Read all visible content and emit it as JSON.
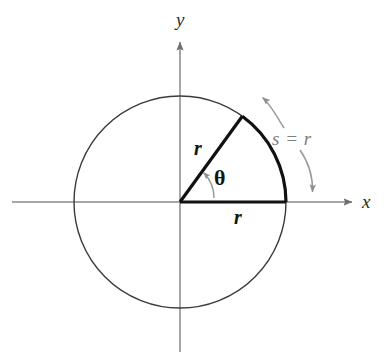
{
  "figure": {
    "background_color": "#ffffff"
  },
  "axes": {
    "x_label": "x",
    "y_label": "y",
    "axis_color": "#8a8a8a",
    "origin": {
      "x": 180,
      "y": 202
    }
  },
  "circle": {
    "center_x": 180,
    "center_y": 202,
    "radius": 106,
    "stroke_color": "#3a3a3a",
    "stroke_width": 1.4
  },
  "sector": {
    "radius_horizontal_label": "r",
    "radius_slanted_label": "r",
    "angle_label": "θ",
    "arc_label": "s = r",
    "angle_degrees": 54,
    "stroke_color": "#111111",
    "stroke_width": 3.2
  },
  "annotations": {
    "arc_label_color": "#7d7d7d",
    "pointer_color": "#8f8f8f",
    "upper_pointer_target": "arc-top-endpoint",
    "lower_pointer_target": "arc-bottom-endpoint"
  }
}
